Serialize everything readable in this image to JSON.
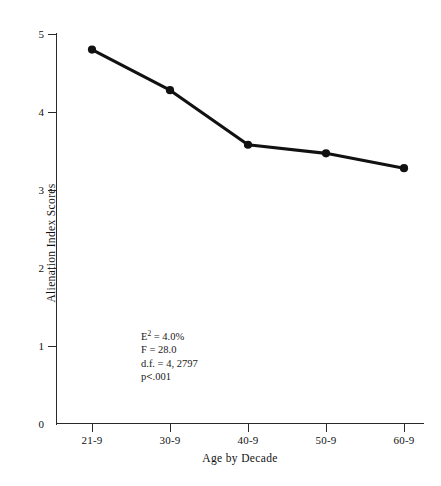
{
  "chart_data": {
    "type": "line",
    "title": "",
    "xlabel": "Age by Decade",
    "ylabel": "Alienation Index Scores",
    "categories": [
      "21-9",
      "30-9",
      "40-9",
      "50-9",
      "60-9"
    ],
    "values": [
      4.8,
      4.28,
      3.58,
      3.47,
      3.28
    ],
    "series": [
      {
        "name": "Alienation Index Scores",
        "values": [
          4.8,
          4.28,
          3.58,
          3.47,
          3.28
        ]
      }
    ],
    "ylim": [
      0,
      5
    ],
    "yticks": [
      0,
      1,
      2,
      3,
      4,
      5
    ],
    "ytick_labels": [
      "0",
      "1",
      "2",
      "3",
      "4",
      "5"
    ],
    "grid": false,
    "legend": false,
    "marker": "filled-circle",
    "line_color": "#111111",
    "marker_color": "#111111",
    "background_color": "#ffffff",
    "annotations": [
      {
        "text": "E2 = 4.0%",
        "base": "E",
        "exponent": "2",
        "rest": " = 4.0%"
      },
      {
        "text": "F  =  28.0"
      },
      {
        "text": "d.f.  =  4, 2797"
      },
      {
        "text": "p<.001"
      }
    ]
  },
  "axes": {
    "y_title": "Alienation Index Scores",
    "x_title": "Age by Decade",
    "y_tick_labels": [
      "5",
      "4",
      "3",
      "2",
      "1",
      "0"
    ],
    "x_tick_labels": [
      "21-9",
      "30-9",
      "40-9",
      "50-9",
      "60-9"
    ]
  },
  "stats": {
    "e_squared_base": "E",
    "e_squared_exponent": "2",
    "e_squared_value": " =  4.0%",
    "f_line": "F  =  28.0",
    "df_line": "d.f.  =  4, 2797",
    "p_prefix": "p",
    "p_operator": "<",
    "p_value": ".001"
  }
}
